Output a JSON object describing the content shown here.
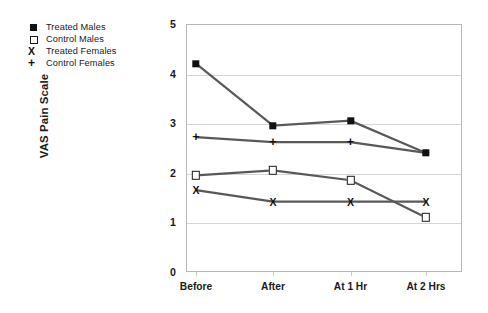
{
  "chart_data": {
    "type": "line",
    "title": "",
    "xlabel": "",
    "ylabel": "VAS Pain Scale",
    "categories": [
      "Before",
      "After",
      "At 1 Hr",
      "At 2 Hrs"
    ],
    "ylim": [
      0,
      5
    ],
    "yticks": [
      "0",
      "1",
      "2",
      "3",
      "4",
      "5"
    ],
    "grid": true,
    "legend_position": "top-left-outside",
    "series": [
      {
        "name": "Treated Males",
        "marker": "filled-square",
        "color": "#111111",
        "values": [
          4.2,
          2.95,
          3.05,
          2.4
        ]
      },
      {
        "name": "Control Males",
        "marker": "open-square",
        "color": "#1a1a1a",
        "values": [
          1.95,
          2.05,
          1.85,
          1.1
        ]
      },
      {
        "name": "Treated Females",
        "marker": "x",
        "color": "#111111",
        "values": [
          1.65,
          1.42,
          1.42,
          1.42
        ]
      },
      {
        "name": "Control Females",
        "marker": "plus",
        "color": "#111111",
        "values": [
          2.72,
          2.62,
          2.62,
          2.4
        ]
      }
    ]
  },
  "legend": {
    "items": [
      {
        "label": "Treated Males",
        "marker": "filled-square"
      },
      {
        "label": "Control Males",
        "marker": "open-square"
      },
      {
        "label": "Treated Females",
        "marker": "x"
      },
      {
        "label": "Control Females",
        "marker": "plus"
      }
    ]
  },
  "glyphs": {
    "x": "X",
    "plus": "+"
  },
  "colors": {
    "line": "#595959",
    "marker": "#111111",
    "grid": "#d6d6d6",
    "frame": "#b9b9b9",
    "text": "#1a1a1a",
    "background": "#ffffff"
  }
}
